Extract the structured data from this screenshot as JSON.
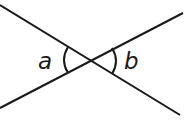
{
  "diagram": {
    "lines": [
      {
        "name": "line-1",
        "x1": 0,
        "y1": 5,
        "x2": 180,
        "y2": 115
      },
      {
        "name": "line-2",
        "x1": 0,
        "y1": 108,
        "x2": 183,
        "y2": 13
      }
    ],
    "intersection": {
      "x": 90,
      "y": 61
    },
    "angles": [
      {
        "label": "a",
        "side": "left"
      },
      {
        "label": "b",
        "side": "right"
      }
    ],
    "stroke_color": "#1a1a1a"
  }
}
